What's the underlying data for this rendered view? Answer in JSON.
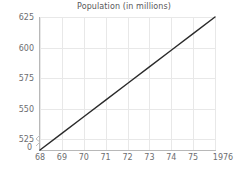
{
  "chart_data": {
    "type": "line",
    "title": "Population (in millions)",
    "xlabel": "",
    "ylabel": "",
    "x": [
      1968,
      1969,
      1970,
      1971,
      1972,
      1973,
      1974,
      1975,
      1976
    ],
    "values": [
      516,
      529.6,
      543.3,
      556.9,
      570.5,
      584.1,
      597.8,
      611.4,
      625
    ],
    "series": [
      {
        "name": "Population",
        "values": [
          516,
          529.6,
          543.3,
          556.9,
          570.5,
          584.1,
          597.8,
          611.4,
          625
        ]
      }
    ],
    "x_tick_labels": [
      "68",
      "69",
      "70",
      "71",
      "72",
      "73",
      "74",
      "75",
      "1976"
    ],
    "y_tick_labels": [
      "525",
      "550",
      "575",
      "600",
      "625"
    ],
    "y_tick_values": [
      525,
      550,
      575,
      600,
      625
    ],
    "y_axis_break_label": "0",
    "ylim": [
      516,
      625
    ],
    "xlim": [
      1968,
      1976
    ],
    "grid": true,
    "legend": false,
    "line_color": "#2b2b2b",
    "grid_color": "#e8e8e8",
    "axis_color": "#b8b8b8",
    "text_color": "#6d6d70",
    "title_color": "#58585a"
  }
}
